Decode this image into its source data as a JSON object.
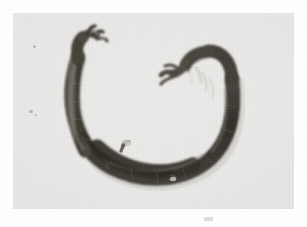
{
  "page": {
    "background_color": "#fefefe",
    "width": 307,
    "height": 227,
    "scan_mark_label": ""
  },
  "photograph": {
    "caption": "",
    "type": "black-and-white photograph",
    "background_color": "#e9e8e6",
    "frame": {
      "left": 13,
      "top": 13,
      "width": 281,
      "height": 196
    },
    "subject": {
      "name": "curved rope-like specimen",
      "description": "A single dark, elongated, rope- or worm-like specimen arranged in an open crescent that opens upward, photographed from above against a plain pale backdrop.",
      "color_dark": "#37352f",
      "color_mid": "#4d4a44",
      "color_highlight": "#7d7a72",
      "orientation": "crescent opening upward",
      "left_tip": "frayed forked tip pointing up and slightly left",
      "right_tip": "hooked end curling inward with a split, shredded tip",
      "surface_features": [
        {
          "name": "upper-arc-nub",
          "description": "small pale protrusion on the upper edge of the lower-left arc"
        },
        {
          "name": "lower-arc-nub",
          "description": "small pale protrusion on the lower edge of the bottom arc"
        }
      ]
    }
  }
}
